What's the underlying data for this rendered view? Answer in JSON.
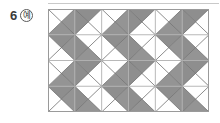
{
  "label": {
    "number": "6",
    "badge": "예"
  },
  "figure": {
    "name": "triangle-tessellation-pattern",
    "grid": {
      "columns": 6,
      "rows": 4,
      "cell_width": 26.83,
      "cell_height": 25.75,
      "origin_x": 48,
      "origin_y": 9,
      "width": 161,
      "height": 103
    },
    "colors": {
      "shaded_fill": "#949494",
      "shaded_fill_alt": "#8e8e8e",
      "unshaded_fill": "#ffffff",
      "grid_line": "#b0b0b0",
      "diagonal_line": "#6f6f6f",
      "outer_border": "#9a9a9a",
      "top_rule": "#c9c9c9",
      "text": "#3a3a3a"
    },
    "cells": [
      {
        "col": 0,
        "row": 0,
        "top": false,
        "right": true,
        "bottom": true,
        "left": false
      },
      {
        "col": 1,
        "row": 0,
        "top": true,
        "right": false,
        "bottom": false,
        "left": true
      },
      {
        "col": 2,
        "row": 0,
        "top": false,
        "right": true,
        "bottom": true,
        "left": false
      },
      {
        "col": 3,
        "row": 0,
        "top": true,
        "right": false,
        "bottom": false,
        "left": true
      },
      {
        "col": 4,
        "row": 0,
        "top": false,
        "right": true,
        "bottom": true,
        "left": false
      },
      {
        "col": 5,
        "row": 0,
        "top": true,
        "right": false,
        "bottom": false,
        "left": true
      },
      {
        "col": 0,
        "row": 1,
        "top": true,
        "right": true,
        "bottom": false,
        "left": false
      },
      {
        "col": 1,
        "row": 1,
        "top": false,
        "right": false,
        "bottom": true,
        "left": true
      },
      {
        "col": 2,
        "row": 1,
        "top": true,
        "right": true,
        "bottom": false,
        "left": false
      },
      {
        "col": 3,
        "row": 1,
        "top": false,
        "right": false,
        "bottom": true,
        "left": true
      },
      {
        "col": 4,
        "row": 1,
        "top": true,
        "right": true,
        "bottom": false,
        "left": false
      },
      {
        "col": 5,
        "row": 1,
        "top": false,
        "right": false,
        "bottom": true,
        "left": true
      },
      {
        "col": 0,
        "row": 2,
        "top": false,
        "right": true,
        "bottom": true,
        "left": false
      },
      {
        "col": 1,
        "row": 2,
        "top": true,
        "right": false,
        "bottom": false,
        "left": true
      },
      {
        "col": 2,
        "row": 2,
        "top": false,
        "right": true,
        "bottom": true,
        "left": false
      },
      {
        "col": 3,
        "row": 2,
        "top": true,
        "right": false,
        "bottom": false,
        "left": true
      },
      {
        "col": 4,
        "row": 2,
        "top": false,
        "right": true,
        "bottom": true,
        "left": false
      },
      {
        "col": 5,
        "row": 2,
        "top": true,
        "right": false,
        "bottom": false,
        "left": true
      },
      {
        "col": 0,
        "row": 3,
        "top": true,
        "right": true,
        "bottom": false,
        "left": false
      },
      {
        "col": 1,
        "row": 3,
        "top": false,
        "right": false,
        "bottom": true,
        "left": true
      },
      {
        "col": 2,
        "row": 3,
        "top": true,
        "right": true,
        "bottom": false,
        "left": false
      },
      {
        "col": 3,
        "row": 3,
        "top": false,
        "right": false,
        "bottom": true,
        "left": true
      },
      {
        "col": 4,
        "row": 3,
        "top": true,
        "right": true,
        "bottom": false,
        "left": false
      },
      {
        "col": 5,
        "row": 3,
        "top": false,
        "right": false,
        "bottom": true,
        "left": true
      }
    ]
  }
}
